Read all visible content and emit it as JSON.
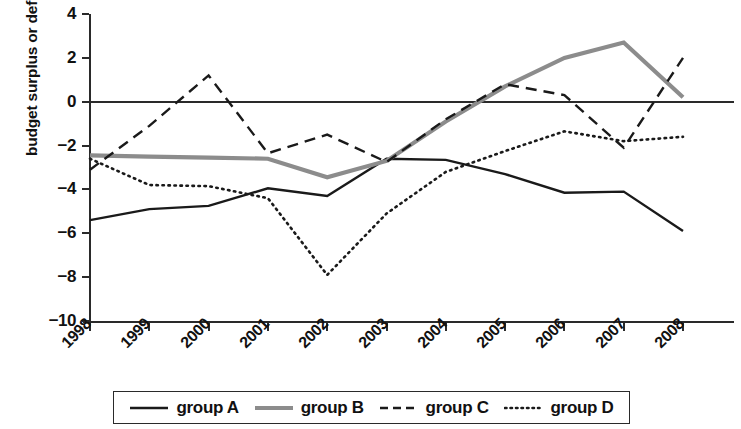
{
  "chart_data": {
    "type": "line",
    "title": "",
    "xlabel": "",
    "ylabel": "budget surplus or deficit, % of GDP",
    "categories": [
      "1998",
      "1999",
      "2000",
      "2001",
      "2002",
      "2003",
      "2004",
      "2005",
      "2006",
      "2007",
      "2008"
    ],
    "x": [
      1998,
      1999,
      2000,
      2001,
      2002,
      2003,
      2004,
      2005,
      2006,
      2007,
      2008
    ],
    "xlim": [
      1998,
      2008
    ],
    "ylim": [
      -10,
      4
    ],
    "yticks": [
      4,
      2,
      0,
      -2,
      -4,
      -6,
      -8,
      -10
    ],
    "ytick_labels": [
      "4",
      "2",
      "0",
      "−2",
      "−4",
      "−6",
      "−8",
      "−10"
    ],
    "grid": false,
    "zero_line": true,
    "legend_position": "bottom",
    "series": [
      {
        "name": "group A",
        "style": "solid",
        "color": "#1a1a1a",
        "width": 2.4,
        "values": [
          -5.4,
          -4.9,
          -4.75,
          -3.95,
          -4.3,
          -2.6,
          -2.65,
          -3.3,
          -4.15,
          -4.1,
          -5.9
        ]
      },
      {
        "name": "group B",
        "style": "solid",
        "color": "#8c8c8c",
        "width": 4.2,
        "values": [
          -2.45,
          -2.5,
          -2.55,
          -2.6,
          -3.45,
          -2.7,
          -0.9,
          0.7,
          2.0,
          2.7,
          0.2
        ]
      },
      {
        "name": "group C",
        "style": "dashed",
        "color": "#1a1a1a",
        "width": 2.4,
        "values": [
          -3.1,
          -1.1,
          1.2,
          -2.35,
          -1.5,
          -2.75,
          -0.8,
          0.8,
          0.3,
          -2.1,
          2.0
        ]
      },
      {
        "name": "group D",
        "style": "dotted",
        "color": "#1a1a1a",
        "width": 2.6,
        "values": [
          -2.6,
          -3.8,
          -3.85,
          -4.4,
          -7.9,
          -5.1,
          -3.2,
          -2.25,
          -1.35,
          -1.8,
          -1.6
        ]
      }
    ]
  },
  "legend": {
    "items": [
      {
        "label": "group A",
        "key": "solid-black-line"
      },
      {
        "label": "group B",
        "key": "solid-gray-thick-line"
      },
      {
        "label": "group C",
        "key": "dashed-black-line"
      },
      {
        "label": "group D",
        "key": "dotted-black-line"
      }
    ]
  }
}
